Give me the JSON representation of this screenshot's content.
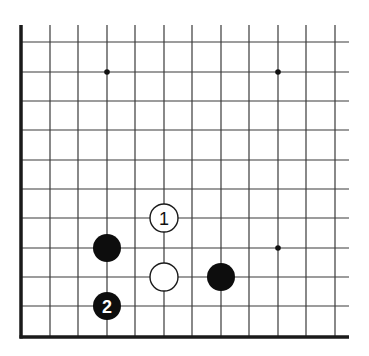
{
  "diagram": {
    "type": "go-board-fragment",
    "geometry": {
      "columns_x": [
        21,
        50,
        78,
        107,
        135,
        164,
        192,
        221,
        249,
        278,
        306,
        335
      ],
      "rows_y": [
        42,
        72,
        101,
        130,
        160,
        189,
        218,
        248,
        277,
        306,
        337
      ],
      "top_open_y": 25,
      "right_open_x": 349,
      "left_edge_x": 21,
      "bottom_edge_y": 337,
      "stone_radius": 14,
      "star_radius": 2.8
    },
    "edges": {
      "left": "board-edge",
      "bottom": "board-edge",
      "top": "open",
      "right": "open"
    },
    "star_points": [
      {
        "col": 3,
        "row": 1
      },
      {
        "col": 9,
        "row": 1
      },
      {
        "col": 9,
        "row": 7
      }
    ],
    "stones": [
      {
        "color": "black",
        "col": 3,
        "row": 7,
        "label": ""
      },
      {
        "color": "black",
        "col": 3,
        "row": 9,
        "label": "2"
      },
      {
        "color": "white",
        "col": 5,
        "row": 6,
        "label": "1"
      },
      {
        "color": "white",
        "col": 5,
        "row": 8,
        "label": ""
      },
      {
        "color": "black",
        "col": 7,
        "row": 8,
        "label": ""
      }
    ],
    "colors": {
      "black": "#0d0d0d",
      "white": "#ffffff",
      "line": "#3a3a3a"
    }
  }
}
